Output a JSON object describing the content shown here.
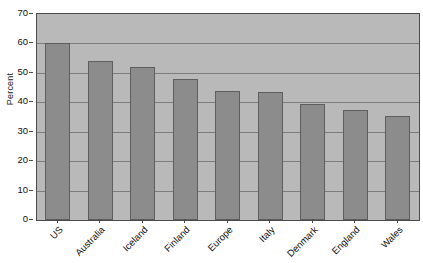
{
  "chart_data": {
    "type": "bar",
    "title": "",
    "subtitle": "",
    "xlabel": "",
    "ylabel": "Percent",
    "ylim": [
      0,
      70
    ],
    "ytick_step": 10,
    "yticks": [
      0,
      10,
      20,
      30,
      40,
      50,
      60,
      70
    ],
    "ytick_labels": [
      "0",
      "10",
      "20",
      "30",
      "40",
      "50",
      "60",
      "70"
    ],
    "grid": "horizontal",
    "legend": "none",
    "categories": [
      "US",
      "Australia",
      "Iceland",
      "Finland",
      "Europe",
      "Italy",
      "Denmark",
      "England",
      "Wales"
    ],
    "values": [
      60,
      54,
      52,
      48,
      44,
      43.5,
      39.5,
      37.5,
      35.5
    ],
    "annotations": []
  },
  "style": {
    "plot_background": "#b9b9b9",
    "bar_fill": "#8c8c8c",
    "bar_border": "#5e5e5e",
    "gridline_color": "#7d7d7d",
    "axis_color": "#4a4a4a",
    "text_color": "#111111",
    "page_background": "#ffffff"
  }
}
